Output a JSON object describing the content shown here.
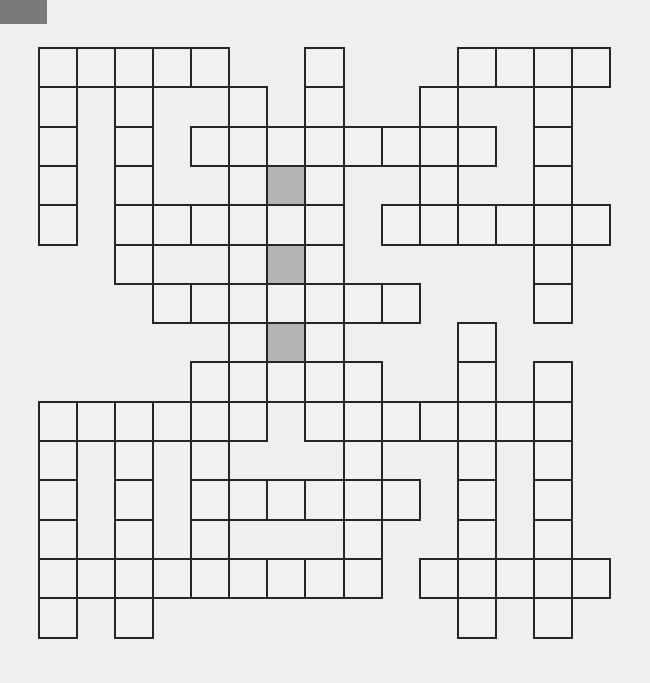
{
  "puzzle": {
    "type": "crossword-fill-in-grid",
    "rows": 15,
    "cols": 15,
    "origin_x": 38,
    "origin_y": 47,
    "cell_w": 38.07,
    "cell_h": 39.3,
    "colors": {
      "background": "#efefee",
      "cell": "#f1f1f0",
      "shaded": "#b4b4b4",
      "border": "#262626",
      "corner_mark": "#7a7a7a"
    },
    "cells_by_row": [
      [
        0,
        1,
        2,
        3,
        4,
        7,
        11,
        12,
        13,
        14
      ],
      [
        0,
        2,
        5,
        7,
        10,
        13
      ],
      [
        0,
        2,
        4,
        5,
        6,
        7,
        8,
        9,
        10,
        11,
        13
      ],
      [
        0,
        2,
        5,
        6,
        7,
        10,
        13
      ],
      [
        0,
        2,
        3,
        4,
        5,
        6,
        7,
        9,
        10,
        11,
        12,
        13,
        14
      ],
      [
        2,
        5,
        6,
        7,
        13
      ],
      [
        3,
        4,
        5,
        6,
        7,
        8,
        9,
        13
      ],
      [
        5,
        6,
        7,
        11
      ],
      [
        4,
        5,
        6,
        7,
        8,
        11,
        13
      ],
      [
        0,
        1,
        2,
        3,
        4,
        5,
        7,
        8,
        9,
        10,
        11,
        12,
        13
      ],
      [
        0,
        2,
        4,
        8,
        11,
        13
      ],
      [
        0,
        2,
        4,
        5,
        6,
        7,
        8,
        9,
        11,
        13
      ],
      [
        0,
        2,
        4,
        8,
        11,
        13
      ],
      [
        0,
        1,
        2,
        3,
        4,
        5,
        6,
        7,
        8,
        10,
        11,
        12,
        13,
        14
      ],
      [
        0,
        2,
        11,
        13
      ]
    ],
    "shaded_cells": [
      [
        3,
        6
      ],
      [
        5,
        6
      ],
      [
        7,
        6
      ]
    ]
  }
}
